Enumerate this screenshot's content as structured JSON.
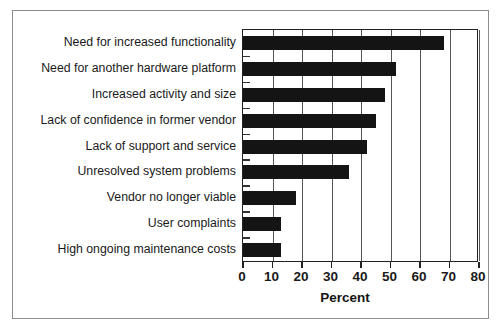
{
  "chart_data": {
    "type": "bar",
    "orientation": "horizontal",
    "title": "",
    "xlabel": "Percent",
    "ylabel": "",
    "xlim": [
      0,
      80
    ],
    "xticks": [
      0,
      10,
      20,
      30,
      40,
      50,
      60,
      70,
      80
    ],
    "grid": true,
    "grid_axis": "x",
    "legend": false,
    "bar_color": "#141414",
    "categories": [
      "Need for increased functionality",
      "Need for another hardware platform",
      "Increased activity and size",
      "Lack of confidence in former vendor",
      "Lack of support and service",
      "Unresolved system problems",
      "Vendor no longer viable",
      "User complaints",
      "High ongoing maintenance costs"
    ],
    "values": [
      68,
      52,
      48,
      45,
      42,
      36,
      18,
      13,
      13
    ],
    "series": [
      {
        "name": "Percent",
        "values": [
          68,
          52,
          48,
          45,
          42,
          36,
          18,
          13,
          13
        ]
      }
    ]
  },
  "axis": {
    "tick_labels": [
      "0",
      "10",
      "20",
      "30",
      "40",
      "50",
      "60",
      "70",
      "80"
    ],
    "title": "Percent"
  },
  "colors": {
    "bar": "#141414",
    "frame": "#8d8d8d",
    "axis": "#222222",
    "gridline": "#555555",
    "background": "#ffffff"
  }
}
